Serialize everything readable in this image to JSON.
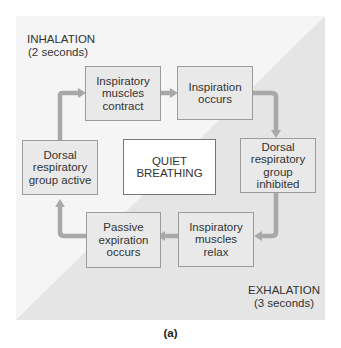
{
  "diagram": {
    "phases": {
      "inhalation": {
        "label": "INHALATION",
        "duration": "(2 seconds)"
      },
      "exhalation": {
        "label": "EXHALATION",
        "duration": "(3 seconds)"
      }
    },
    "center": {
      "line1": "QUIET",
      "line2": "BREATHING"
    },
    "steps": [
      {
        "id": "inspiratory-muscles-contract",
        "text": "Inspiratory muscles contract"
      },
      {
        "id": "inspiration-occurs",
        "text": "Inspiration occurs"
      },
      {
        "id": "drg-inhibited",
        "text": "Dorsal respiratory group inhibited"
      },
      {
        "id": "inspiratory-muscles-relax",
        "text": "Inspiratory muscles relax"
      },
      {
        "id": "passive-expiration-occurs",
        "text": "Passive expiration occurs"
      },
      {
        "id": "drg-active",
        "text": "Dorsal respiratory group active"
      }
    ],
    "caption": "(a)",
    "colors": {
      "box_fill": "#e9e9e9",
      "arrow": "#a8a8a8",
      "upper_bg": "#f4f4f4",
      "lower_bg": "#e6e6e6"
    }
  }
}
